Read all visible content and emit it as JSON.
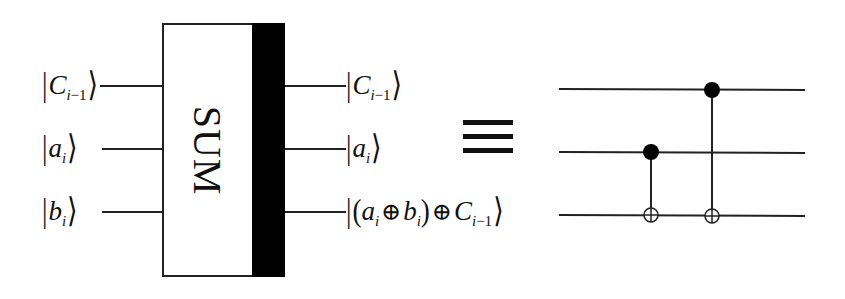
{
  "gate": {
    "label": "SUM",
    "inputs": [
      {
        "symbol": "C",
        "sub": "i−1",
        "sub_var": "i",
        "sub_rest": "−1"
      },
      {
        "symbol": "a",
        "sub": "i"
      },
      {
        "symbol": "b",
        "sub": "i"
      }
    ],
    "outputs": [
      {
        "symbol": "C",
        "sub_var": "i",
        "sub_rest": "−1"
      },
      {
        "symbol": "a",
        "sub": "i"
      },
      {
        "expr": "(a_i ⊕ b_i) ⊕ C_{i−1}",
        "a": "a",
        "a_sub": "i",
        "b": "b",
        "b_sub": "i",
        "xor": "⊕",
        "c": "C",
        "c_sub_var": "i",
        "c_sub_rest": "−1",
        "lparen": "(",
        "rparen": ")"
      }
    ],
    "ket_left": "|",
    "ket_right": "⟩"
  },
  "equivalence_symbol": "≡",
  "circuit": {
    "wires": 3,
    "gates": [
      {
        "type": "CNOT",
        "control_wire": 2,
        "target_wire": 3
      },
      {
        "type": "CNOT",
        "control_wire": 1,
        "target_wire": 3
      }
    ]
  },
  "colors": {
    "line": "#222222",
    "fill": "#000000",
    "background": "#ffffff"
  }
}
